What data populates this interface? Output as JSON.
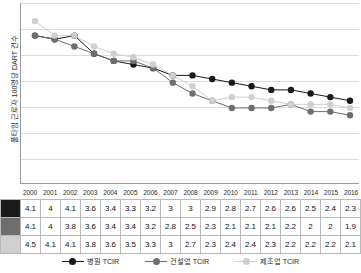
{
  "chart_data": {
    "type": "line",
    "title": "",
    "xlabel": "",
    "ylabel": "풀타임 근로자 100명당 DART 건수",
    "categories": [
      "2000",
      "2001",
      "2002",
      "2003",
      "2004",
      "2005",
      "2006",
      "2007",
      "2008",
      "2009",
      "2010",
      "2011",
      "2012",
      "2013",
      "2014",
      "2015",
      "2016"
    ],
    "ylim": [
      0,
      5
    ],
    "grid": true,
    "y_tick_labels_shown": false,
    "legend_position": "bottom",
    "series": [
      {
        "name": "병원 TCIR",
        "color": "#1a1a1a",
        "values": [
          4.1,
          4,
          4.1,
          3.6,
          3.4,
          3.3,
          3.2,
          3,
          3,
          2.9,
          2.8,
          2.7,
          2.6,
          2.6,
          2.5,
          2.4,
          2.3
        ]
      },
      {
        "name": "건설업 TCIR",
        "color": "#6e6e6e",
        "values": [
          4.1,
          4,
          3.8,
          3.6,
          3.4,
          3.4,
          3.2,
          2.8,
          2.5,
          2.3,
          2.1,
          2.1,
          2.1,
          2.2,
          2,
          2,
          1.9
        ]
      },
      {
        "name": "제조업 TCIR",
        "color": "#cfcfcf",
        "values": [
          4.5,
          4.1,
          4.1,
          3.8,
          3.6,
          3.5,
          3.3,
          3,
          2.7,
          2.3,
          2.4,
          2.4,
          2.3,
          2.2,
          2.2,
          2.2,
          2.1
        ]
      }
    ]
  },
  "table": {
    "years": [
      "2000",
      "2001",
      "2002",
      "2003",
      "2004",
      "2005",
      "2006",
      "2007",
      "2008",
      "2009",
      "2010",
      "2011",
      "2012",
      "2013",
      "2014",
      "2015",
      "2016"
    ],
    "rows": [
      {
        "swatch_color": "#1a1a1a",
        "series": "병원 TCIR",
        "values": [
          "4.1",
          "4",
          "4.1",
          "3.6",
          "3.4",
          "3.3",
          "3.2",
          "3",
          "3",
          "2.9",
          "2.8",
          "2.7",
          "2.6",
          "2.6",
          "2.5",
          "2.4",
          "2.3"
        ]
      },
      {
        "swatch_color": "#6e6e6e",
        "series": "건설업 TCIR",
        "values": [
          "4.1",
          "4",
          "3.8",
          "3.6",
          "3.4",
          "3.4",
          "3.2",
          "2.8",
          "2.5",
          "2.3",
          "2.1",
          "2.1",
          "2.1",
          "2.2",
          "2",
          "2",
          "1.9"
        ]
      },
      {
        "swatch_color": "#cfcfcf",
        "series": "제조업 TCIR",
        "values": [
          "4.5",
          "4.1",
          "4.1",
          "3.8",
          "3.6",
          "3.5",
          "3.3",
          "3",
          "2.7",
          "2.3",
          "2.4",
          "2.4",
          "2.3",
          "2.2",
          "2.2",
          "2.2",
          "2.1"
        ]
      }
    ]
  },
  "legend": {
    "items": [
      {
        "label": "병원 TCIR",
        "color": "#1a1a1a"
      },
      {
        "label": "건설업 TCIR",
        "color": "#6e6e6e"
      },
      {
        "label": "제조업 TCIR",
        "color": "#cfcfcf"
      }
    ]
  }
}
